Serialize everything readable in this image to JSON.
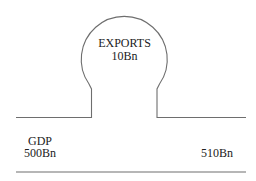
{
  "diagram": {
    "bulge": {
      "label": "EXPORTS",
      "value": "10Bn"
    },
    "left": {
      "label": "GDP",
      "value": "500Bn"
    },
    "right": {
      "value": "510Bn"
    },
    "colors": {
      "stroke": "#6e6e6e",
      "text": "#222222",
      "background": "#ffffff"
    }
  }
}
